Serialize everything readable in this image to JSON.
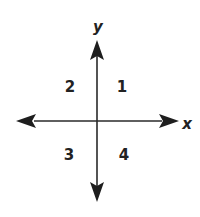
{
  "diagram": {
    "type": "cartesian-quadrants",
    "axes": {
      "x_label": "x",
      "y_label": "y",
      "color": "#2a2a2a"
    },
    "quadrants": [
      {
        "label": "1",
        "position": "upper-right"
      },
      {
        "label": "2",
        "position": "upper-left"
      },
      {
        "label": "3",
        "position": "lower-left"
      },
      {
        "label": "4",
        "position": "lower-right"
      }
    ]
  }
}
